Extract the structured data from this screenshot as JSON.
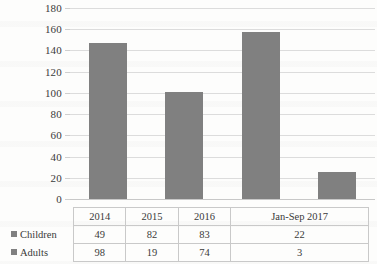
{
  "chart_data": {
    "type": "bar",
    "title": "",
    "xlabel": "",
    "ylabel": "",
    "ylim": [
      0,
      180
    ],
    "yticks": [
      0,
      20,
      40,
      60,
      80,
      100,
      120,
      140,
      160,
      180
    ],
    "grid": true,
    "legend_position": "row-labels-in-table",
    "categories": [
      "2014",
      "2015",
      "2016",
      "Jan-Sep 2017"
    ],
    "series": [
      {
        "name": "Children",
        "values": [
          49,
          82,
          83,
          22
        ]
      },
      {
        "name": "Adults",
        "values": [
          98,
          19,
          74,
          3
        ]
      }
    ],
    "bar_totals": [
      147,
      101,
      157,
      25
    ],
    "bar_color": "#808080",
    "gridline_color": "#dcdcdc",
    "table_border_color": "#c9c9c9",
    "text_color": "#3a3a3a"
  },
  "axis": {
    "tick_labels": [
      "180",
      "160",
      "140",
      "120",
      "100",
      "80",
      "60",
      "40",
      "20",
      "0"
    ]
  },
  "table": {
    "column_headers": [
      "2014",
      "2015",
      "2016",
      "Jan-Sep 2017"
    ],
    "rows": [
      {
        "label": "Children",
        "cells": [
          "49",
          "82",
          "83",
          "22"
        ]
      },
      {
        "label": "Adults",
        "cells": [
          "98",
          "19",
          "74",
          "3"
        ]
      }
    ]
  },
  "icons": {
    "legend_marker": "legend-square-icon"
  }
}
